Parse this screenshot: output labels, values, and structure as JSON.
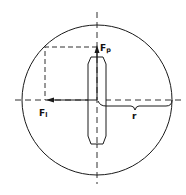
{
  "diagram": {
    "labels": {
      "force_parallel": {
        "main": "F",
        "sub": "p"
      },
      "force_lateral": {
        "main": "F",
        "sub": "l"
      },
      "radius": "r"
    },
    "colors": {
      "stroke": "#1a1a1a",
      "background": "#ffffff"
    }
  }
}
